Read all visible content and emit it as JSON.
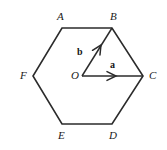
{
  "figure": {
    "type": "geometry-diagram",
    "shape": "regular-hexagon",
    "stroke_color": "#2b2b2b",
    "background_color": "#ffffff",
    "label_color": "#1a1a1a"
  },
  "vertices": [
    {
      "id": "A",
      "label": "A",
      "x": 62,
      "y": 28,
      "label_x": 57,
      "label_y": 11
    },
    {
      "id": "B",
      "label": "B",
      "x": 112,
      "y": 28,
      "label_x": 110,
      "label_y": 11
    },
    {
      "id": "C",
      "label": "C",
      "x": 143,
      "y": 76,
      "label_x": 149,
      "label_y": 70
    },
    {
      "id": "D",
      "label": "D",
      "x": 112,
      "y": 124,
      "label_x": 109,
      "label_y": 130
    },
    {
      "id": "E",
      "label": "E",
      "x": 62,
      "y": 124,
      "label_x": 58,
      "label_y": 130
    },
    {
      "id": "F",
      "label": "F",
      "x": 33,
      "y": 76,
      "label_x": 20,
      "label_y": 70
    }
  ],
  "centre": {
    "id": "O",
    "label": "O",
    "x": 82,
    "y": 76,
    "label_x": 71,
    "label_y": 70
  },
  "vectors": [
    {
      "id": "a",
      "label": "a",
      "from": "O",
      "to": "C",
      "x1": 82,
      "y1": 76,
      "x2": 143,
      "y2": 76,
      "arrowhead_x": 116,
      "arrowhead_y": 76,
      "label_x": 110,
      "label_y": 60
    },
    {
      "id": "b",
      "label": "b",
      "from": "O",
      "to": "B",
      "x1": 82,
      "y1": 76,
      "x2": 112,
      "y2": 28,
      "arrowhead_x": 101,
      "arrowhead_y": 45,
      "label_x": 77,
      "label_y": 47
    }
  ],
  "edges": [
    {
      "from": "A",
      "to": "B"
    },
    {
      "from": "B",
      "to": "C"
    },
    {
      "from": "C",
      "to": "D"
    },
    {
      "from": "D",
      "to": "E"
    },
    {
      "from": "E",
      "to": "F"
    },
    {
      "from": "F",
      "to": "A"
    }
  ]
}
